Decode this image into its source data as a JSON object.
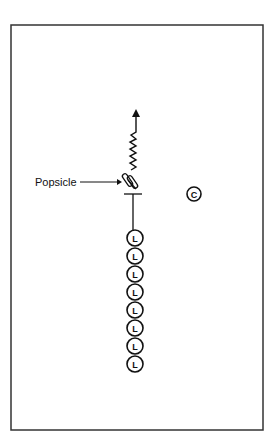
{
  "diagram": {
    "type": "drill-diagram",
    "frame": {
      "x": 11,
      "y": 25,
      "width": 252,
      "height": 405,
      "stroke": "#333333"
    },
    "annotation": {
      "label": "Popsicle",
      "target": "popsicle-marker"
    },
    "players": {
      "coach": {
        "letter": "C",
        "x": 194,
        "y": 194
      },
      "line_letter": "L",
      "line": [
        {
          "letter": "L",
          "x": 135,
          "y": 238
        },
        {
          "letter": "L",
          "x": 135,
          "y": 256
        },
        {
          "letter": "L",
          "x": 135,
          "y": 274
        },
        {
          "letter": "L",
          "x": 135,
          "y": 292
        },
        {
          "letter": "L",
          "x": 135,
          "y": 310
        },
        {
          "letter": "L",
          "x": 135,
          "y": 328
        },
        {
          "letter": "L",
          "x": 135,
          "y": 346
        },
        {
          "letter": "L",
          "x": 135,
          "y": 364
        }
      ]
    },
    "path": {
      "description": "zigzag dribble path ending in arrow pointing up"
    }
  }
}
